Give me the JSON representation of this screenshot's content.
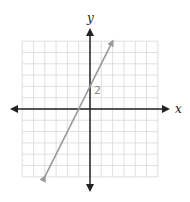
{
  "chart_data": {
    "type": "line",
    "title": "",
    "xlabel": "x",
    "ylabel": "y",
    "xlim": [
      -6,
      6
    ],
    "ylim": [
      -6,
      6
    ],
    "grid": true,
    "grid_step": 1,
    "annotations": [
      {
        "text": "2",
        "x": 0,
        "y": 2,
        "note": "y-intercept label"
      }
    ],
    "series": [
      {
        "name": "line",
        "equation": "y = 2x + 2",
        "x": [
          -4,
          2
        ],
        "y": [
          -6,
          6
        ],
        "color": "#999999",
        "arrows_both_ends": true
      }
    ]
  },
  "labels": {
    "x_axis": "x",
    "y_axis": "y",
    "intercept": "2"
  },
  "colors": {
    "grid": "#d8d8d8",
    "axis": "#222222",
    "line": "#9a9a9a"
  }
}
